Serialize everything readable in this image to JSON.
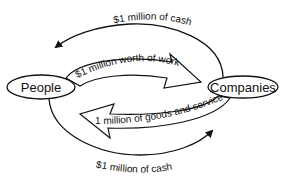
{
  "diagram": {
    "nodes": [
      {
        "id": "people",
        "label": "People"
      },
      {
        "id": "companies",
        "label": "Companies"
      }
    ],
    "edges": [
      {
        "id": "cash-top",
        "from": "companies",
        "to": "people",
        "label": "$1 million of cash"
      },
      {
        "id": "work",
        "from": "people",
        "to": "companies",
        "label": "$1 million worth of work"
      },
      {
        "id": "goods",
        "from": "companies",
        "to": "people",
        "label": "$1 million of goods and services"
      },
      {
        "id": "cash-bottom",
        "from": "people",
        "to": "companies",
        "label": "$1 million of cash"
      }
    ]
  },
  "colors": {
    "stroke": "#111111",
    "background": "#ffffff"
  }
}
